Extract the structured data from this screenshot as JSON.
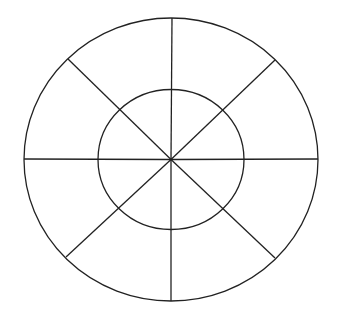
{
  "diagram": {
    "type": "concentric-circles-with-8-spokes",
    "background": "#ffffff",
    "stroke_color": "#222222",
    "stroke_width": 1.3,
    "center": {
      "x": 171,
      "y": 159.5
    },
    "outer_ellipse": {
      "rx": 147,
      "ry": 141.5
    },
    "inner_ellipse": {
      "rx": 73,
      "ry": 70
    },
    "spokes": [
      {
        "name": "top",
        "x": 172,
        "y": 18
      },
      {
        "name": "upper-right",
        "x": 275,
        "y": 60
      },
      {
        "name": "right",
        "x": 318,
        "y": 159
      },
      {
        "name": "lower-right",
        "x": 275,
        "y": 258
      },
      {
        "name": "bottom",
        "x": 171,
        "y": 301
      },
      {
        "name": "lower-left",
        "x": 66,
        "y": 257
      },
      {
        "name": "left",
        "x": 24,
        "y": 159
      },
      {
        "name": "upper-left",
        "x": 68,
        "y": 59
      }
    ]
  }
}
